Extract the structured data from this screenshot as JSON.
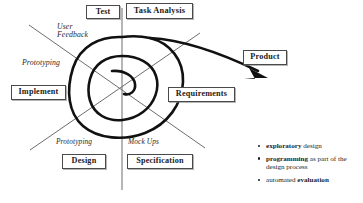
{
  "diagram": {
    "type": "spiral-lifecycle-model",
    "nodes": [
      {
        "label": "Test",
        "quadrant": "upper-left",
        "emphasis": "bold"
      },
      {
        "label": "Task Analysis",
        "quadrant": "upper-right",
        "emphasis": "bold"
      },
      {
        "label": "Product",
        "quadrant": "right-outer",
        "emphasis": "bold"
      },
      {
        "label": "Implement",
        "quadrant": "left",
        "emphasis": "bold"
      },
      {
        "label": "Requirements",
        "quadrant": "right",
        "emphasis": "bold"
      },
      {
        "label": "Design",
        "quadrant": "lower-left",
        "emphasis": "bold"
      },
      {
        "label": "Specification",
        "quadrant": "lower-right",
        "emphasis": "bold"
      }
    ],
    "axis_labels": [
      {
        "line1": "User",
        "line2": "Feedback"
      },
      {
        "line1": "Prototyping",
        "line2": ""
      },
      {
        "line1": "Prototyping",
        "line2": ""
      },
      {
        "line1": "Mock Ups",
        "line2": ""
      }
    ],
    "arrow": {
      "label": "Product",
      "direction": "outward-to-right"
    },
    "colors": {
      "spiral_stroke": "#111111",
      "axis_stroke": "#6d6d6d",
      "box_border": "#4a4a4a",
      "text": "#1a1a1a",
      "background": "#ffffff"
    }
  },
  "bullets": [
    {
      "strong": "exploratory ",
      "rest": "design"
    },
    {
      "strong": "programming ",
      "rest": "as part of the design process"
    },
    {
      "strong": "evaluation",
      "rest": "automated "
    }
  ]
}
